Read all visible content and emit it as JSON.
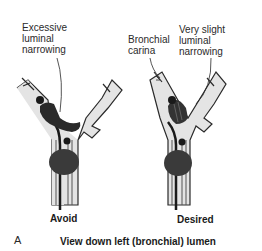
{
  "figure": {
    "panel_letter": "A",
    "caption": "View down left (bronchial) lumen",
    "left": {
      "annotation": "Excessive\nluminal\nnarrowing",
      "label": "Avoid"
    },
    "right": {
      "annotation_carina": "Bronchial\ncarina",
      "annotation_narrowing": "Very slight\nluminal\nnarrowing",
      "label": "Desired"
    }
  },
  "colors": {
    "airway_fill": "#e4e4e4",
    "airway_outline": "#2a2a2a",
    "cuff_fill": "#3a3a3a",
    "tube_dark": "#1a1a1a"
  }
}
